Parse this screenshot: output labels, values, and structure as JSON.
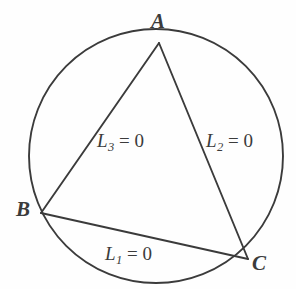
{
  "figure": {
    "type": "geometry-diagram",
    "background_color": "#fefefe",
    "ink_color": "#3b3b3b",
    "circle": {
      "center_x": 156,
      "center_y": 156,
      "radius": 127,
      "stroke_width": 1.9
    },
    "vertices": [
      {
        "id": "A",
        "label": "A",
        "x": 159,
        "y": 43
      },
      {
        "id": "B",
        "label": "B",
        "x": 41,
        "y": 213
      },
      {
        "id": "C",
        "label": "C",
        "x": 248,
        "y": 259
      }
    ],
    "sides": [
      {
        "id": "L1",
        "from": "B",
        "to": "C",
        "label_base": "L",
        "label_sub": "1",
        "label_eq": " = 0",
        "label_full": "L1 = 0"
      },
      {
        "id": "L2",
        "from": "A",
        "to": "C",
        "label_base": "L",
        "label_sub": "2",
        "label_eq": " = 0",
        "label_full": "L2 = 0"
      },
      {
        "id": "L3",
        "from": "A",
        "to": "B",
        "label_base": "L",
        "label_sub": "3",
        "label_eq": " = 0",
        "label_full": "L3 = 0"
      }
    ],
    "labels": {
      "vertex_a": "A",
      "vertex_b": "B",
      "vertex_c": "C",
      "l1_base": "L",
      "l1_sub": "1",
      "l1_eq": "= 0",
      "l2_base": "L",
      "l2_sub": "2",
      "l2_eq": "= 0",
      "l3_base": "L",
      "l3_sub": "3",
      "l3_eq": "= 0"
    }
  }
}
